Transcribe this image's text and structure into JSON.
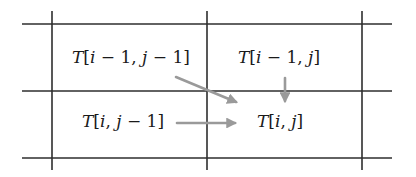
{
  "diagram": {
    "colors": {
      "grid": "#2e2e2e",
      "arrow": "#9a9a9a",
      "text": "#1a1a1a"
    },
    "cells": [
      {
        "id": "top-left",
        "label": "T[i − 1, j − 1]",
        "parts": [
          "T",
          "[",
          "i",
          " − 1, ",
          "j",
          " − 1]"
        ]
      },
      {
        "id": "top-right",
        "label": "T[i − 1, j]",
        "parts": [
          "T",
          "[",
          "i",
          " − 1, ",
          "j",
          "]"
        ]
      },
      {
        "id": "bottom-left",
        "label": "T[i, j − 1]",
        "parts": [
          "T",
          "[",
          "i",
          ", ",
          "j",
          " − 1]"
        ]
      },
      {
        "id": "bottom-right",
        "label": "T[i, j]",
        "parts": [
          "T",
          "[",
          "i",
          ", ",
          "j",
          "]"
        ]
      }
    ],
    "arrows": [
      {
        "from": "T[i − 1, j − 1]",
        "to": "T[i, j]",
        "direction": "diagonal"
      },
      {
        "from": "T[i − 1, j]",
        "to": "T[i, j]",
        "direction": "down"
      },
      {
        "from": "T[i, j − 1]",
        "to": "T[i, j]",
        "direction": "right"
      }
    ]
  }
}
